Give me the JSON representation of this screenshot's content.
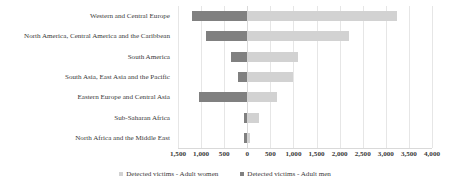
{
  "chart_data": {
    "type": "bar",
    "orientation": "horizontal",
    "layout": "diverging-stacked",
    "title": "",
    "subtitle": "",
    "xlabel": "",
    "ylabel": "",
    "grid": true,
    "legend_position": "bottom",
    "xlim": [
      -1500,
      4000
    ],
    "xticks": [
      -1500,
      -1000,
      -500,
      0,
      500,
      1000,
      1500,
      2000,
      2500,
      3000,
      3500,
      4000
    ],
    "xtick_labels": [
      "1,500",
      "1,000",
      "500",
      "0",
      "500",
      "1,000",
      "1,500",
      "2,000",
      "2,500",
      "3,000",
      "3,500",
      "4,000"
    ],
    "categories": [
      "Western and Central Europe",
      "North America, Central America and the Caribbean",
      "South America",
      "South Asia, East Asia and the Pacific",
      "Eastern Europe and Central Asia",
      "Sub-Saharan Africa",
      "North Africa and the Middle East"
    ],
    "series": [
      {
        "name": "Detected victims - Adult men",
        "color": "#808080",
        "direction": "left",
        "values": [
          1200,
          900,
          350,
          200,
          1050,
          80,
          80
        ]
      },
      {
        "name": "Detected victims - Adult women",
        "color": "#d2d2d2",
        "direction": "right",
        "values": [
          3250,
          2200,
          1100,
          1000,
          650,
          260,
          70
        ]
      }
    ]
  },
  "legend": {
    "items": [
      {
        "label": "Detected victims - Adult women",
        "swatch": "women"
      },
      {
        "label": "Detected victims - Adult men",
        "swatch": "men"
      }
    ]
  }
}
